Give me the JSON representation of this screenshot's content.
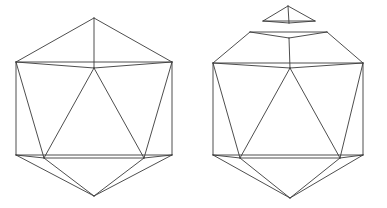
{
  "figure": {
    "title": "Icosahedron and icosahedron with detached pentagonal cap",
    "background_color": "#ffffff",
    "line_color": "#3a3a3a",
    "line_width": 0.9,
    "canvas": {
      "width": 387,
      "height": 208
    },
    "panels": [
      {
        "id": "left-icosahedron",
        "name": "intact-icosahedron",
        "caption": "",
        "vertices": {
          "top_apex": [
            94,
            18
          ],
          "upper_ring": [
            [
              16,
              62
            ],
            [
              60,
              40
            ],
            [
              128,
              40
            ],
            [
              172,
              62
            ],
            [
              94,
              68
            ]
          ],
          "lower_ring": [
            [
              16,
              155
            ],
            [
              44,
              158
            ],
            [
              144,
              158
            ],
            [
              172,
              155
            ],
            [
              94,
              164
            ]
          ],
          "bottom_apex": [
            94,
            196
          ]
        },
        "edges": [
          [
            [
              94,
              18
            ],
            [
              16,
              62
            ]
          ],
          [
            [
              94,
              18
            ],
            [
              172,
              62
            ]
          ],
          [
            [
              94,
              18
            ],
            [
              94,
              68
            ]
          ],
          [
            [
              16,
              62
            ],
            [
              94,
              68
            ]
          ],
          [
            [
              172,
              62
            ],
            [
              94,
              68
            ]
          ],
          [
            [
              16,
              62
            ],
            [
              172,
              62
            ]
          ],
          [
            [
              16,
              62
            ],
            [
              16,
              155
            ]
          ],
          [
            [
              172,
              62
            ],
            [
              172,
              155
            ]
          ],
          [
            [
              16,
              62
            ],
            [
              44,
              158
            ]
          ],
          [
            [
              172,
              62
            ],
            [
              144,
              158
            ]
          ],
          [
            [
              94,
              68
            ],
            [
              44,
              158
            ]
          ],
          [
            [
              94,
              68
            ],
            [
              144,
              158
            ]
          ],
          [
            [
              44,
              158
            ],
            [
              144,
              158
            ]
          ],
          [
            [
              16,
              155
            ],
            [
              44,
              158
            ]
          ],
          [
            [
              172,
              155
            ],
            [
              144,
              158
            ]
          ],
          [
            [
              16,
              155
            ],
            [
              94,
              196
            ]
          ],
          [
            [
              172,
              155
            ],
            [
              94,
              196
            ]
          ],
          [
            [
              44,
              158
            ],
            [
              94,
              196
            ]
          ],
          [
            [
              144,
              158
            ],
            [
              94,
              196
            ]
          ],
          [
            [
              16,
              155
            ],
            [
              172,
              155
            ]
          ]
        ]
      },
      {
        "id": "right-icosahedron-opened",
        "name": "icosahedron-with-removed-cap",
        "caption": "",
        "cap": {
          "apex": [
            288,
            6
          ],
          "base_left": [
            263,
            21
          ],
          "base_right": [
            315,
            21
          ],
          "base_mid_front": [
            289,
            23
          ],
          "edges": [
            [
              [
                288,
                6
              ],
              [
                263,
                21
              ]
            ],
            [
              [
                288,
                6
              ],
              [
                315,
                21
              ]
            ],
            [
              [
                288,
                6
              ],
              [
                289,
                23
              ]
            ],
            [
              [
                263,
                21
              ],
              [
                289,
                23
              ]
            ],
            [
              [
                315,
                21
              ],
              [
                289,
                23
              ]
            ],
            [
              [
                263,
                21
              ],
              [
                315,
                21
              ]
            ]
          ]
        },
        "opening": {
          "left": [
            250,
            32
          ],
          "right": [
            327,
            32
          ],
          "front_mid": [
            289,
            38
          ],
          "back_mid": [
            289,
            30
          ],
          "edges": [
            [
              [
                250,
                32
              ],
              [
                327,
                32
              ]
            ],
            [
              [
                250,
                32
              ],
              [
                289,
                38
              ]
            ],
            [
              [
                327,
                32
              ],
              [
                289,
                38
              ]
            ]
          ]
        },
        "vertices": {
          "opening_ring": [
            [
              250,
              32
            ],
            [
              327,
              32
            ],
            [
              289,
              38
            ]
          ],
          "upper_ring": [
            [
              213,
              63
            ],
            [
              257,
              41
            ],
            [
              322,
              41
            ],
            [
              363,
              63
            ],
            [
              290,
              68
            ]
          ],
          "lower_ring": [
            [
              213,
              155
            ],
            [
              240,
              158
            ],
            [
              340,
              158
            ],
            [
              363,
              155
            ],
            [
              290,
              164
            ]
          ],
          "bottom_apex": [
            290,
            198
          ]
        },
        "edges": [
          [
            [
              250,
              32
            ],
            [
              213,
              63
            ]
          ],
          [
            [
              327,
              32
            ],
            [
              363,
              63
            ]
          ],
          [
            [
              289,
              38
            ],
            [
              290,
              68
            ]
          ],
          [
            [
              250,
              32
            ],
            [
              289,
              38
            ]
          ],
          [
            [
              327,
              32
            ],
            [
              289,
              38
            ]
          ],
          [
            [
              250,
              32
            ],
            [
              327,
              32
            ]
          ],
          [
            [
              213,
              63
            ],
            [
              290,
              68
            ]
          ],
          [
            [
              363,
              63
            ],
            [
              290,
              68
            ]
          ],
          [
            [
              213,
              63
            ],
            [
              363,
              63
            ]
          ],
          [
            [
              213,
              63
            ],
            [
              213,
              155
            ]
          ],
          [
            [
              363,
              63
            ],
            [
              363,
              155
            ]
          ],
          [
            [
              213,
              63
            ],
            [
              240,
              158
            ]
          ],
          [
            [
              363,
              63
            ],
            [
              340,
              158
            ]
          ],
          [
            [
              290,
              68
            ],
            [
              240,
              158
            ]
          ],
          [
            [
              290,
              68
            ],
            [
              340,
              158
            ]
          ],
          [
            [
              240,
              158
            ],
            [
              340,
              158
            ]
          ],
          [
            [
              213,
              155
            ],
            [
              240,
              158
            ]
          ],
          [
            [
              363,
              155
            ],
            [
              340,
              158
            ]
          ],
          [
            [
              213,
              155
            ],
            [
              290,
              198
            ]
          ],
          [
            [
              363,
              155
            ],
            [
              290,
              198
            ]
          ],
          [
            [
              240,
              158
            ],
            [
              290,
              198
            ]
          ],
          [
            [
              340,
              158
            ],
            [
              290,
              198
            ]
          ],
          [
            [
              213,
              155
            ],
            [
              363,
              155
            ]
          ]
        ]
      }
    ]
  }
}
